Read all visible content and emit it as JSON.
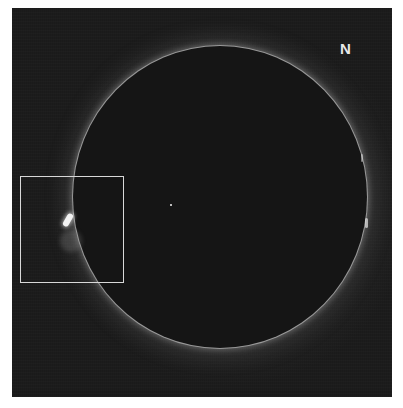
{
  "image": {
    "description": "Solar H-alpha full-disk image with occulted disk, limb prominence highlighted",
    "orientation_label": "N",
    "highlight_box": {
      "label": "prominence-region"
    },
    "colors": {
      "background": "#1c1c1c",
      "disk": "#151515",
      "limb": "#d2d2d2",
      "box": "#d8d8d8",
      "page": "#ffffff"
    }
  }
}
